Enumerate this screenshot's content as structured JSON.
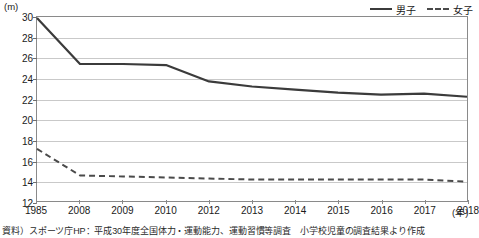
{
  "chart_data": {
    "type": "line",
    "title": "",
    "xlabel": "年",
    "ylabel": "(m)",
    "y_unit": "(m)",
    "x_unit": "(年)",
    "grid": true,
    "legend_position": "top-right",
    "ylim": [
      12,
      30
    ],
    "yticks": [
      12,
      14,
      16,
      18,
      20,
      22,
      24,
      26,
      28,
      30
    ],
    "categories": [
      "1985",
      "2008",
      "2009",
      "2010",
      "2012",
      "2013",
      "2014",
      "2015",
      "2016",
      "2017",
      "2018"
    ],
    "series": [
      {
        "name": "男子",
        "style": "solid",
        "color": "#3b3b3b",
        "values": [
          29.9,
          25.4,
          25.4,
          25.3,
          23.7,
          23.2,
          22.9,
          22.6,
          22.4,
          22.5,
          22.2
        ]
      },
      {
        "name": "女子",
        "style": "dashed",
        "color": "#4a4a4a",
        "values": [
          17.1,
          14.5,
          14.4,
          14.3,
          14.2,
          14.1,
          14.1,
          14.1,
          14.1,
          14.1,
          13.9
        ]
      }
    ]
  },
  "legend": {
    "entries": [
      {
        "label": "男子",
        "style": "solid"
      },
      {
        "label": "女子",
        "style": "dashed"
      }
    ]
  },
  "source": {
    "note": "資料）スポーツ庁HP：平成30年度全国体力・運動能力、運動習慣等調査　小学校児童の調査結果より作成"
  }
}
